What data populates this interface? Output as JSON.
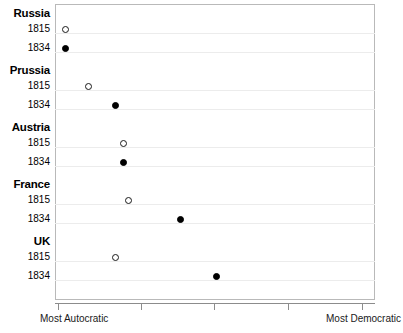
{
  "chart_data": {
    "type": "scatter",
    "title": "",
    "subtitle": "",
    "xlabel": "",
    "ylabel": "",
    "grid": true,
    "legend_position": "none",
    "xlim": [
      0,
      10
    ],
    "x_axis_left_annotation": "Most Autocratic",
    "x_axis_right_annotation": "Most Democratic",
    "x_tick_labels": [
      "",
      "",
      "",
      "",
      ""
    ],
    "x_tick_values": [
      1,
      3,
      5,
      7,
      9
    ],
    "categories": [
      "Russia",
      "Prussia",
      "Austria",
      "France",
      "UK"
    ],
    "series": [
      {
        "name": "1815",
        "marker": "open-circle",
        "color": "#1a1a1a",
        "values": [
          0.35,
          1.05,
          2.15,
          2.3,
          1.9
        ]
      },
      {
        "name": "1834",
        "marker": "filled-circle",
        "color": "#000000",
        "values": [
          0.35,
          1.9,
          2.15,
          3.95,
          5.1
        ]
      }
    ],
    "points": [
      {
        "group": "Russia",
        "year": "1815",
        "marker": "open-circle",
        "value": 0.35
      },
      {
        "group": "Russia",
        "year": "1834",
        "marker": "filled-circle",
        "value": 0.35
      },
      {
        "group": "Prussia",
        "year": "1815",
        "marker": "open-circle",
        "value": 1.05
      },
      {
        "group": "Prussia",
        "year": "1834",
        "marker": "filled-circle",
        "value": 1.9
      },
      {
        "group": "Austria",
        "year": "1815",
        "marker": "open-circle",
        "value": 2.15
      },
      {
        "group": "Austria",
        "year": "1834",
        "marker": "filled-circle",
        "value": 2.15
      },
      {
        "group": "France",
        "year": "1815",
        "marker": "open-circle",
        "value": 2.3
      },
      {
        "group": "France",
        "year": "1834",
        "marker": "filled-circle",
        "value": 3.95
      },
      {
        "group": "UK",
        "year": "1815",
        "marker": "open-circle",
        "value": 1.9
      },
      {
        "group": "UK",
        "year": "1834",
        "marker": "filled-circle",
        "value": 5.1
      }
    ]
  },
  "axis": {
    "left_annotation": "Most Autocratic",
    "right_annotation": "Most Democratic"
  },
  "rows": [
    {
      "kind": "group",
      "label": "Russia",
      "y": 14
    },
    {
      "kind": "year",
      "label": "1815",
      "y": 29,
      "marker": "open-circle",
      "x": 65
    },
    {
      "kind": "year",
      "label": "1834",
      "y": 48,
      "marker": "filled-circle",
      "x": 65
    },
    {
      "kind": "group",
      "label": "Prussia",
      "y": 71
    },
    {
      "kind": "year",
      "label": "1815",
      "y": 86,
      "marker": "open-circle",
      "x": 88
    },
    {
      "kind": "year",
      "label": "1834",
      "y": 105,
      "marker": "filled-circle",
      "x": 115
    },
    {
      "kind": "group",
      "label": "Austria",
      "y": 128
    },
    {
      "kind": "year",
      "label": "1815",
      "y": 143,
      "marker": "open-circle",
      "x": 123
    },
    {
      "kind": "year",
      "label": "1834",
      "y": 162,
      "marker": "filled-circle",
      "x": 123
    },
    {
      "kind": "group",
      "label": "France",
      "y": 185
    },
    {
      "kind": "year",
      "label": "1815",
      "y": 200,
      "marker": "open-circle",
      "x": 128
    },
    {
      "kind": "year",
      "label": "1834",
      "y": 219,
      "marker": "filled-circle",
      "x": 180
    },
    {
      "kind": "group",
      "label": "UK",
      "y": 242
    },
    {
      "kind": "year",
      "label": "1815",
      "y": 257,
      "marker": "open-circle",
      "x": 115
    },
    {
      "kind": "year",
      "label": "1834",
      "y": 276,
      "marker": "filled-circle",
      "x": 216
    }
  ],
  "gridlines_y": [
    33,
    52,
    90,
    109,
    147,
    166,
    204,
    223,
    261,
    280
  ],
  "xticks_x": [
    58,
    141,
    214,
    288,
    362
  ]
}
